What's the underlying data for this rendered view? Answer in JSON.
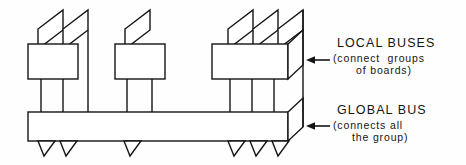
{
  "diagram": {
    "type": "technical-line-drawing",
    "stroke_color": "#141414",
    "fill_color": "#ffffff",
    "background_color": "#ffffff",
    "stroke_width": 1.4
  },
  "labels": {
    "local": {
      "title": "LOCAL BUSES",
      "sub_line1": "(connect  groups",
      "sub_line2": "of boards)"
    },
    "global": {
      "title": "GLOBAL BUS",
      "sub_line1": "(connects all",
      "sub_line2": "the group)"
    }
  },
  "arrows": {
    "local_arrow": "left-arrow",
    "global_arrow": "left-arrow"
  },
  "structure": {
    "groups": [
      {
        "name": "group-1",
        "board_count": 2,
        "local_bus_x": 28,
        "local_bus_width": 50
      },
      {
        "name": "group-2",
        "board_count": 1,
        "local_bus_x": 115,
        "local_bus_width": 50
      },
      {
        "name": "group-3",
        "board_count": 3,
        "local_bus_x": 212,
        "local_bus_width": 76
      }
    ],
    "global_bus": {
      "name": "global-bus",
      "x": 28,
      "y": 112,
      "width": 260,
      "height": 29,
      "tab_count": 6
    },
    "total_boards": 6,
    "total_local_buses": 3
  }
}
